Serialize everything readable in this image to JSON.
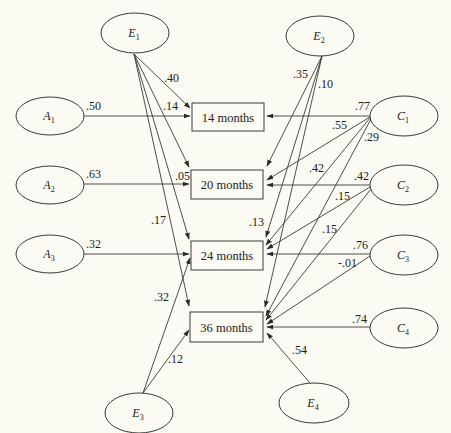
{
  "diagram": {
    "type": "path-diagram",
    "boxes": [
      {
        "id": "m14",
        "label": "14 months",
        "x": 192,
        "y": 103,
        "w": 72,
        "h": 28
      },
      {
        "id": "m20",
        "label": "20 months",
        "x": 191,
        "y": 170,
        "w": 72,
        "h": 29
      },
      {
        "id": "m24",
        "label": "24 months",
        "x": 191,
        "y": 241,
        "w": 72,
        "h": 29
      },
      {
        "id": "m36",
        "label": "36 months",
        "x": 190,
        "y": 312,
        "w": 73,
        "h": 30
      }
    ],
    "ellipses": [
      {
        "id": "E1",
        "base": "E",
        "sub": "1",
        "cx": 135,
        "cy": 33,
        "rx": 34,
        "ry": 20
      },
      {
        "id": "E2",
        "base": "E",
        "sub": "2",
        "cx": 320,
        "cy": 36,
        "rx": 34,
        "ry": 20
      },
      {
        "id": "A1",
        "base": "A",
        "sub": "1",
        "cx": 50,
        "cy": 116,
        "rx": 34,
        "ry": 19
      },
      {
        "id": "A2",
        "base": "A",
        "sub": "2",
        "cx": 50,
        "cy": 185,
        "rx": 34,
        "ry": 19
      },
      {
        "id": "A3",
        "base": "A",
        "sub": "3",
        "cx": 50,
        "cy": 254,
        "rx": 34,
        "ry": 19
      },
      {
        "id": "C1",
        "base": "C",
        "sub": "1",
        "cx": 404,
        "cy": 116,
        "rx": 34,
        "ry": 20
      },
      {
        "id": "C2",
        "base": "C",
        "sub": "2",
        "cx": 404,
        "cy": 185,
        "rx": 34,
        "ry": 20
      },
      {
        "id": "C3",
        "base": "C",
        "sub": "3",
        "cx": 404,
        "cy": 255,
        "rx": 34,
        "ry": 20
      },
      {
        "id": "C4",
        "base": "C",
        "sub": "4",
        "cx": 404,
        "cy": 328,
        "rx": 34,
        "ry": 20
      },
      {
        "id": "E3",
        "base": "E",
        "sub": "3",
        "cx": 139,
        "cy": 413,
        "rx": 34,
        "ry": 20
      },
      {
        "id": "E4",
        "base": "E",
        "sub": "4",
        "cx": 314,
        "cy": 403,
        "rx": 35,
        "ry": 20
      }
    ],
    "edges": [
      {
        "from": "A1",
        "to": "m14",
        "x1": 84,
        "y1": 116,
        "x2": 190,
        "y2": 116,
        "label": ".50",
        "lx": 86,
        "ly": 110
      },
      {
        "from": "A2",
        "to": "m20",
        "x1": 84,
        "y1": 184,
        "x2": 189,
        "y2": 184,
        "label": ".63",
        "lx": 86,
        "ly": 178
      },
      {
        "from": "A3",
        "to": "m24",
        "x1": 84,
        "y1": 254,
        "x2": 189,
        "y2": 254,
        "label": ".32",
        "lx": 86,
        "ly": 248
      },
      {
        "from": "E1",
        "to": "m14",
        "x1": 134,
        "y1": 54,
        "x2": 190,
        "y2": 108,
        "label": ".40",
        "lx": 164,
        "ly": 82
      },
      {
        "from": "E1",
        "to": "m20",
        "x1": 134,
        "y1": 54,
        "x2": 189,
        "y2": 167,
        "label": ".14",
        "lx": 163,
        "ly": 110
      },
      {
        "from": "E1",
        "to": "m24",
        "x1": 134,
        "y1": 54,
        "x2": 189,
        "y2": 239,
        "label": ".05",
        "lx": 175,
        "ly": 180
      },
      {
        "from": "E1",
        "to": "m36",
        "x1": 134,
        "y1": 54,
        "x2": 189,
        "y2": 306,
        "label": ".17",
        "lx": 151,
        "ly": 224
      },
      {
        "from": "E3",
        "to": "m24",
        "x1": 143,
        "y1": 393,
        "x2": 190,
        "y2": 258,
        "label": ".32",
        "lx": 154,
        "ly": 301
      },
      {
        "from": "E3",
        "to": "m36",
        "x1": 143,
        "y1": 393,
        "x2": 189,
        "y2": 330,
        "label": ".12",
        "lx": 168,
        "ly": 363
      },
      {
        "from": "E2",
        "to": "m20",
        "x1": 322,
        "y1": 56,
        "x2": 267,
        "y2": 166,
        "label": ".35",
        "lx": 293,
        "ly": 78
      },
      {
        "from": "E2",
        "to": "m24",
        "x1": 322,
        "y1": 56,
        "x2": 266,
        "y2": 237,
        "label": ".10",
        "lx": 318,
        "ly": 88
      },
      {
        "from": "E2",
        "to": "m36",
        "x1": 322,
        "y1": 56,
        "x2": 265,
        "y2": 307,
        "label": ".13",
        "lx": 249,
        "ly": 226
      },
      {
        "from": "C1",
        "to": "m14",
        "x1": 370,
        "y1": 116,
        "x2": 267,
        "y2": 116,
        "label": ".77",
        "lx": 355,
        "ly": 110
      },
      {
        "from": "C1",
        "to": "m20",
        "x1": 370,
        "y1": 117,
        "x2": 267,
        "y2": 180,
        "label": ".55",
        "lx": 332,
        "ly": 129
      },
      {
        "from": "C1",
        "to": "m24",
        "x1": 370,
        "y1": 118,
        "x2": 266,
        "y2": 245,
        "label": ".42",
        "lx": 309,
        "ly": 172
      },
      {
        "from": "C1",
        "to": "m36",
        "x1": 371,
        "y1": 119,
        "x2": 266,
        "y2": 316,
        "label": ".29",
        "lx": 364,
        "ly": 141
      },
      {
        "from": "C2",
        "to": "m20",
        "x1": 370,
        "y1": 185,
        "x2": 267,
        "y2": 185,
        "label": ".42",
        "lx": 354,
        "ly": 180
      },
      {
        "from": "C2",
        "to": "m24",
        "x1": 370,
        "y1": 187,
        "x2": 267,
        "y2": 249,
        "label": ".15",
        "lx": 335,
        "ly": 200
      },
      {
        "from": "C2",
        "to": "m36",
        "x1": 371,
        "y1": 189,
        "x2": 266,
        "y2": 320,
        "label": ".15",
        "lx": 322,
        "ly": 233
      },
      {
        "from": "C3",
        "to": "m24",
        "x1": 370,
        "y1": 254,
        "x2": 267,
        "y2": 254,
        "label": ".76",
        "lx": 353,
        "ly": 249
      },
      {
        "from": "C3",
        "to": "m36",
        "x1": 370,
        "y1": 256,
        "x2": 267,
        "y2": 324,
        "label": "-.01",
        "lx": 338,
        "ly": 267
      },
      {
        "from": "C4",
        "to": "m36",
        "x1": 370,
        "y1": 327,
        "x2": 267,
        "y2": 327,
        "label": ".74",
        "lx": 352,
        "ly": 323
      },
      {
        "from": "E4",
        "to": "m36",
        "x1": 310,
        "y1": 383,
        "x2": 267,
        "y2": 333,
        "label": ".54",
        "lx": 292,
        "ly": 354
      }
    ]
  }
}
